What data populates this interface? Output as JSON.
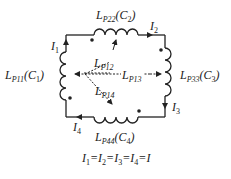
{
  "diagram": {
    "type": "inductive-loop-circuit",
    "inductors": [
      {
        "id": "top",
        "main": "L",
        "sub": "P22",
        "cap": "C",
        "capsub": "2"
      },
      {
        "id": "left",
        "main": "L",
        "sub": "P11",
        "cap": "C",
        "capsub": "1"
      },
      {
        "id": "right",
        "main": "L",
        "sub": "P33",
        "cap": "C",
        "capsub": "3"
      },
      {
        "id": "bottom",
        "main": "L",
        "sub": "P44",
        "cap": "C",
        "capsub": "4"
      }
    ],
    "mutual": [
      {
        "main": "L",
        "sub": "P12"
      },
      {
        "main": "L",
        "sub": "P13"
      },
      {
        "main": "L",
        "sub": "P14"
      }
    ],
    "currents": [
      {
        "main": "I",
        "sub": "1"
      },
      {
        "main": "I",
        "sub": "2"
      },
      {
        "main": "I",
        "sub": "3"
      },
      {
        "main": "I",
        "sub": "4"
      }
    ],
    "equation": {
      "terms": [
        {
          "main": "I",
          "sub": "1"
        },
        {
          "main": "I",
          "sub": "2"
        },
        {
          "main": "I",
          "sub": "3"
        },
        {
          "main": "I",
          "sub": "4"
        },
        {
          "main": "I",
          "sub": ""
        }
      ],
      "separator": "="
    },
    "colors": {
      "line": "#222222",
      "background": "#ffffff"
    }
  }
}
